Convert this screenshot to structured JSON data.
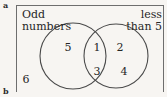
{
  "figure": {
    "part_label": "a",
    "next_part_label": "b",
    "type": "venn-diagram",
    "sets": 2,
    "stroke_color": "#4a4a4a",
    "text_color": "#262626",
    "background_color": "#f7f5f2",
    "border_color": "#6e6e6e"
  },
  "labels": {
    "left": {
      "line1": "Odd",
      "line2": "numbers"
    },
    "right": {
      "line1": "less",
      "line2": "than 5"
    }
  },
  "elements": {
    "left_only": [
      "5"
    ],
    "intersection": [
      "1",
      "3"
    ],
    "right_only": [
      "2",
      "4"
    ],
    "outside": [
      "6"
    ]
  },
  "placed_elements": [
    {
      "value": "5",
      "region": "left-only",
      "x": 68,
      "y": 42
    },
    {
      "value": "1",
      "region": "intersection",
      "x": 97,
      "y": 42
    },
    {
      "value": "2",
      "region": "right-only",
      "x": 120,
      "y": 42
    },
    {
      "value": "3",
      "region": "intersection",
      "x": 97,
      "y": 66
    },
    {
      "value": "4",
      "region": "right-only",
      "x": 124,
      "y": 66
    },
    {
      "value": "6",
      "region": "outside",
      "x": 26,
      "y": 74
    }
  ]
}
